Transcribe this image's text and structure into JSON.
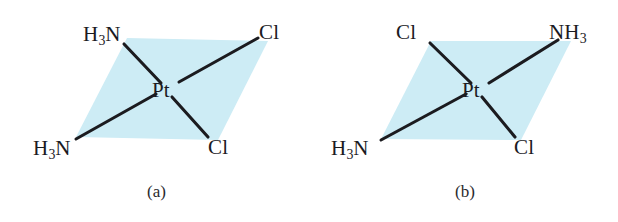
{
  "figure": {
    "background_color": "#ffffff",
    "plane_fill_color": "#cdecf5",
    "bond_color": "#1b1b1f",
    "label_color": "#1b1b1f"
  },
  "chart_data": {
    "type": "diagram",
    "title": "",
    "diagram_kind": "square-planar coordination geometry, cis/trans isomers of Pt(NH3)2Cl2",
    "panels": [
      {
        "caption": "(a)",
        "isomer": "cis",
        "center_atom": "Pt",
        "plane_shape": "parallelogram",
        "ligands": [
          {
            "position": "top-left",
            "formula": "H3N",
            "html": "H<sub>3</sub>N"
          },
          {
            "position": "top-right",
            "formula": "Cl",
            "html": "Cl"
          },
          {
            "position": "bottom-left",
            "formula": "H3N",
            "html": "H<sub>3</sub>N"
          },
          {
            "position": "bottom-right",
            "formula": "Cl",
            "html": "Cl"
          }
        ],
        "bonds": 4
      },
      {
        "caption": "(b)",
        "isomer": "trans",
        "center_atom": "Pt",
        "plane_shape": "parallelogram",
        "ligands": [
          {
            "position": "top-left",
            "formula": "Cl",
            "html": "Cl"
          },
          {
            "position": "top-right",
            "formula": "NH3",
            "html": "NH<sub>3</sub>"
          },
          {
            "position": "bottom-left",
            "formula": "H3N",
            "html": "H<sub>3</sub>N"
          },
          {
            "position": "bottom-right",
            "formula": "Cl",
            "html": "Cl"
          }
        ],
        "bonds": 4
      }
    ]
  },
  "panel_a": {
    "caption": "(a)",
    "center_atom": "Pt",
    "ligand_top_left": "H3N",
    "ligand_top_right": "Cl",
    "ligand_bottom_left": "H3N",
    "ligand_bottom_right": "Cl"
  },
  "panel_b": {
    "caption": "(b)",
    "center_atom": "Pt",
    "ligand_top_left": "Cl",
    "ligand_top_right": "NH3",
    "ligand_bottom_left": "H3N",
    "ligand_bottom_right": "Cl"
  }
}
